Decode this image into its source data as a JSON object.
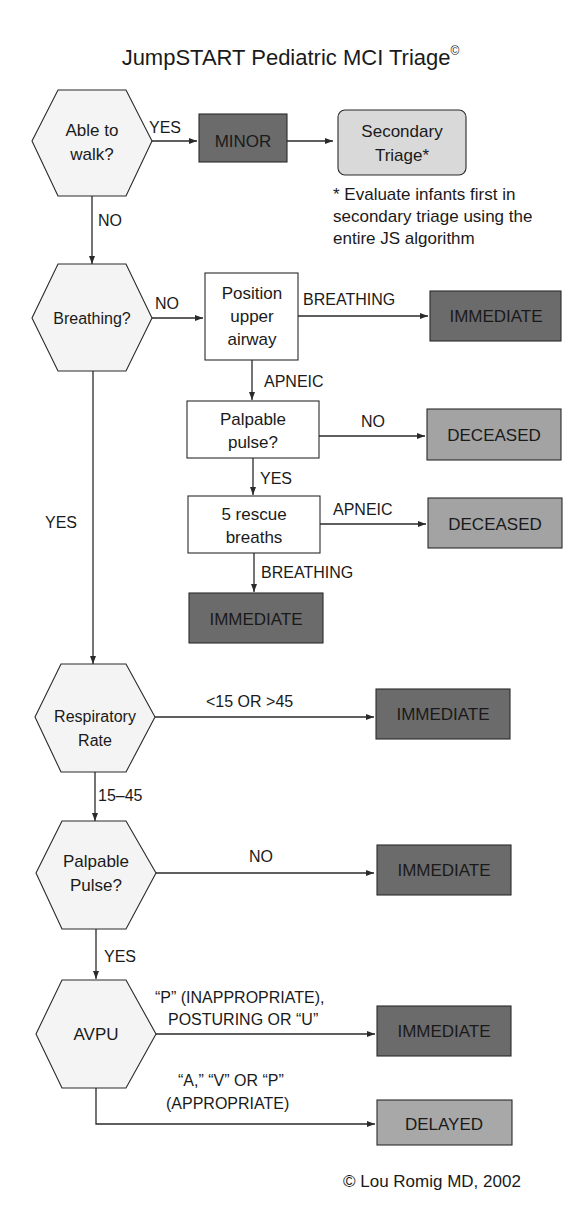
{
  "title": "JumpSTART Pediatric MCI Triage",
  "title_mark": "©",
  "footnote": "* Evaluate infants first in secondary triage using the entire JS algorithm",
  "copyright": "© Lou Romig MD, 2002",
  "colors": {
    "immediate": "#6b6b6b",
    "minor": "#6b6b6b",
    "deceased": "#a3a3a3",
    "delayed": "#a8a8a8",
    "secondary": "#d9d9d9",
    "decision_fill": "#f4f4f4",
    "stroke": "#2a2a2a"
  },
  "nodes": {
    "walk": [
      "Able to",
      "walk?"
    ],
    "minor": "MINOR",
    "secondary": [
      "Secondary",
      "Triage*"
    ],
    "breathing": "Breathing?",
    "position": [
      "Position",
      "upper",
      "airway"
    ],
    "immediate1": "IMMEDIATE",
    "pulse1": [
      "Palpable",
      "pulse?"
    ],
    "deceased1": "DECEASED",
    "rescue": [
      "5 rescue",
      "breaths"
    ],
    "deceased2": "DECEASED",
    "immediate2": "IMMEDIATE",
    "resp": [
      "Respiratory",
      "Rate"
    ],
    "immediate3": "IMMEDIATE",
    "pulse2": [
      "Palpable",
      "Pulse?"
    ],
    "immediate4": "IMMEDIATE",
    "avpu": "AVPU",
    "immediate5": "IMMEDIATE",
    "delayed": "DELAYED"
  },
  "edges": {
    "walk_yes": "YES",
    "walk_no": "NO",
    "breathing_no": "NO",
    "position_breathing": "BREATHING",
    "position_apneic": "APNEIC",
    "pulse1_no": "NO",
    "pulse1_yes": "YES",
    "rescue_apneic": "APNEIC",
    "rescue_breathing": "BREATHING",
    "breathing_yes": "YES",
    "resp_abnormal": "<15 OR >45",
    "resp_normal": "15–45",
    "pulse2_no": "NO",
    "pulse2_yes": "YES",
    "avpu_immediate": [
      "“P” (INAPPROPRIATE),",
      "POSTURING OR “U”"
    ],
    "avpu_delayed": [
      "“A,” “V” OR “P”",
      "(APPROPRIATE)"
    ]
  }
}
